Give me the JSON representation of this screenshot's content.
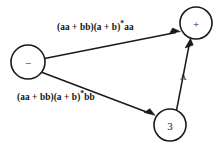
{
  "diagram": {
    "type": "state-transition-graph",
    "background_color": "#ffffff",
    "stroke_color": "#1a1a1a",
    "nodes": [
      {
        "id": "minus",
        "label": "−",
        "cx": 28,
        "cy": 62,
        "r": 17
      },
      {
        "id": "plus",
        "label": "+",
        "cx": 196,
        "cy": 23,
        "r": 16
      },
      {
        "id": "three",
        "label": "3",
        "cx": 170,
        "cy": 125,
        "r": 16
      }
    ],
    "edges": [
      {
        "id": "minus-to-plus",
        "from": "minus",
        "to": "plus",
        "label_prefix": "(aa + bb)(a + b)",
        "label_star": "*",
        "label_suffix": "aa",
        "label_full": "(aa + bb)(a + b)*aa",
        "directed": true
      },
      {
        "id": "minus-to-three",
        "from": "minus",
        "to": "three",
        "label_prefix": "(aa + bb)(a + b)",
        "label_star": "*",
        "label_suffix": "bb",
        "label_full": "(aa + bb)(a + b)*bb",
        "directed": true
      },
      {
        "id": "three-to-plus",
        "from": "three",
        "to": "plus",
        "label_prefix": "Λ",
        "label_star": "",
        "label_suffix": "",
        "label_full": "Λ",
        "directed": true
      }
    ]
  }
}
